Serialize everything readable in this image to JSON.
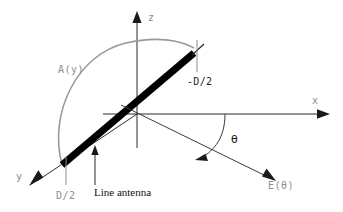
{
  "figure": {
    "background_color": "#ffffff"
  },
  "colors": {
    "axis": "#2b2b2b",
    "antenna": "#000000",
    "amplitude_curve": "#9a9a9a",
    "label_grey": "#8d8d8d",
    "label_black": "#111111",
    "ray": "#3a3a3a"
  },
  "axes": [
    {
      "id": "z",
      "label": "z",
      "direction": "up"
    },
    {
      "id": "x",
      "label": "x",
      "direction": "right"
    },
    {
      "id": "y",
      "label": "y",
      "direction": "down-left"
    }
  ],
  "labels": {
    "amplitude": "A(y)",
    "end_negative": "-D/2",
    "end_positive": "D/2",
    "antenna_callout": "Line antenna",
    "field_ray": "E(θ)",
    "angle": "θ",
    "axis_z": "z",
    "axis_x": "x",
    "axis_y": "y"
  },
  "elements": [
    {
      "name": "z-axis",
      "kind": "arrow"
    },
    {
      "name": "x-axis",
      "kind": "arrow"
    },
    {
      "name": "y-axis",
      "kind": "arrow"
    },
    {
      "name": "line-antenna",
      "kind": "thick-bar"
    },
    {
      "name": "amplitude-distribution-curve",
      "kind": "arc"
    },
    {
      "name": "far-field-ray",
      "kind": "arrow"
    },
    {
      "name": "angle-arc",
      "kind": "arc-arrow"
    },
    {
      "name": "end-tick-negative",
      "kind": "tick"
    },
    {
      "name": "end-tick-positive",
      "kind": "tick"
    },
    {
      "name": "antenna-callout-arrow",
      "kind": "arrow"
    }
  ]
}
